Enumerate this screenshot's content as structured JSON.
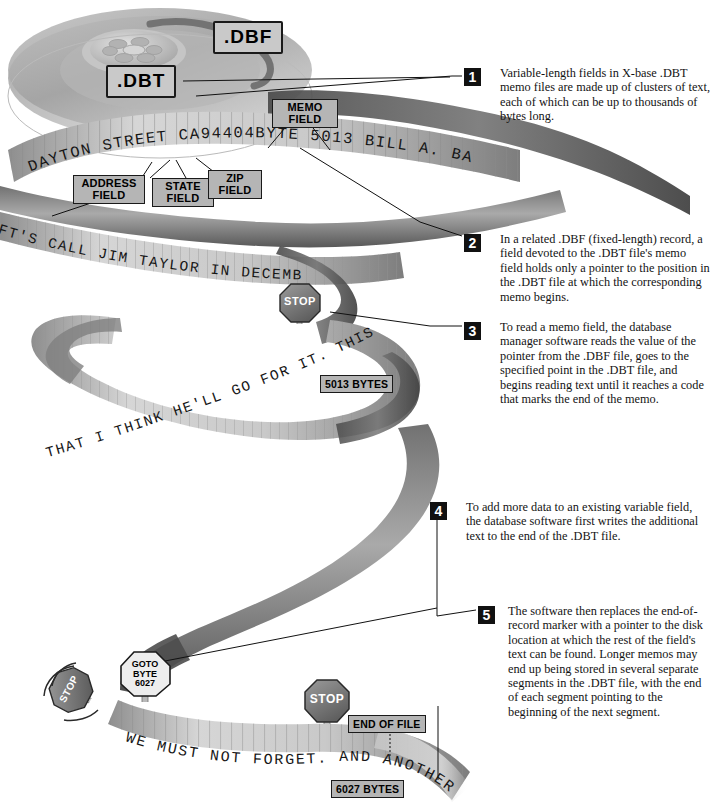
{
  "figure": {
    "medium": "magnetic tape reel illustration"
  },
  "file_labels": [
    {
      "id": "dbf",
      "text": ".DBF"
    },
    {
      "id": "dbt",
      "text": ".DBT"
    }
  ],
  "field_labels": [
    {
      "id": "address-field",
      "line1": "ADDRESS",
      "line2": "FIELD"
    },
    {
      "id": "state-field",
      "line1": "STATE",
      "line2": "FIELD"
    },
    {
      "id": "zip-field",
      "line1": "ZIP",
      "line2": "FIELD"
    },
    {
      "id": "memo-field",
      "line1": "MEMO",
      "line2": "FIELD"
    }
  ],
  "byte_markers": [
    {
      "id": "bytes-5013",
      "text": "5013 BYTES"
    },
    {
      "id": "bytes-6027",
      "text": "6027 BYTES"
    },
    {
      "id": "end-of-file",
      "text": "END OF FILE"
    }
  ],
  "goto_sign": {
    "line1": "GOTO",
    "line2": "BYTE",
    "line3": "6027"
  },
  "stop_signs": [
    {
      "id": "stop-top",
      "text": "STOP"
    },
    {
      "id": "stop-tilted",
      "text": "STOP"
    },
    {
      "id": "stop-bottom",
      "text": "STOP"
    }
  ],
  "tape_text": [
    {
      "id": "record-line",
      "text": "DAYTON STREET  CA94404BYTE 5013 BILL A. BAR"
    },
    {
      "id": "memo-line-1",
      "text": "FT'S CALL JIM TAYLOR IN DECEMB"
    },
    {
      "id": "memo-line-2",
      "text": "THAT I THINK HE'LL GO FOR IT. THIS IS R"
    },
    {
      "id": "memo-line-3",
      "text": "WE MUST NOT FORGET. AND ANOTHER POI"
    }
  ],
  "callouts": [
    {
      "number": "1",
      "text": "Variable-length fields in X-base .DBT memo files are made up of clusters of text, each of which can be up to thousands of bytes long."
    },
    {
      "number": "2",
      "text": "In a related .DBF (fixed-length) record, a field devoted to the .DBT file's memo field holds only a pointer to the position in the .DBT file at which the corresponding memo begins."
    },
    {
      "number": "3",
      "text": "To read a memo field, the database manager software reads the value of the pointer from the .DBF file, goes to the specified point in the .DBT file, and begins reading text until it reaches a code that marks the end of the memo."
    },
    {
      "number": "4",
      "text": "To add more data to an existing variable field, the database software first writes the additional text to the end of the .DBT file."
    },
    {
      "number": "5",
      "text": "The software then replaces the end-of-record marker with a pointer to the disk location at which the rest of the field's text can be found. Longer memos may end up being stored in several separate segments in the .DBT file, with the end of each segment pointing to the beginning of the next segment."
    }
  ],
  "colors": {
    "tape_light": "#d2d2d2",
    "tape_mid": "#9a9a9a",
    "tape_dark": "#5d5d5d",
    "reel": "#a9a9a9",
    "chip": "#b5b5b5",
    "ink": "#111111",
    "stop_sign": "#7a7a7a"
  }
}
